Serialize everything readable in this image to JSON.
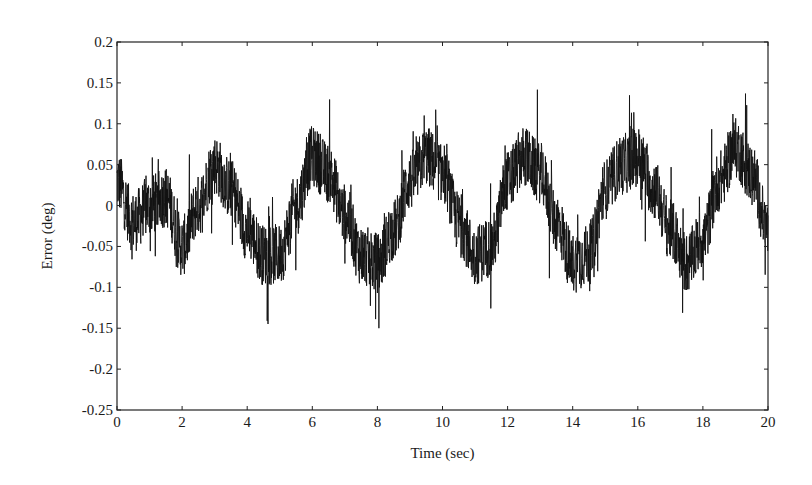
{
  "chart_data": {
    "type": "line",
    "title": "",
    "xlabel": "Time (sec)",
    "ylabel": "Error (deg)",
    "xlim": [
      0,
      20
    ],
    "ylim": [
      -0.25,
      0.2
    ],
    "xticks": [
      0,
      2,
      4,
      6,
      8,
      10,
      12,
      14,
      16,
      18,
      20
    ],
    "xtick_labels": [
      "0",
      "2",
      "4",
      "6",
      "8",
      "10",
      "12",
      "14",
      "16",
      "18",
      "20"
    ],
    "yticks": [
      0.2,
      0.15,
      0.1,
      0.05,
      0,
      -0.05,
      -0.1,
      -0.15,
      -0.2,
      -0.25
    ],
    "ytick_labels": [
      "0.2",
      "0.15",
      "0.1",
      "0.05",
      "0",
      "-0.05",
      "-0.1",
      "-0.15",
      "-0.2",
      "-0.25"
    ],
    "grid": false,
    "legend": null,
    "series": [
      {
        "name": "Error",
        "color": "#111111",
        "description": "Noisy quasi-sinusoidal tracking error, period ~3.2 s, amplitude ~0.07 deg, high-frequency noise ~±0.05 deg",
        "envelope_peaks": [
          {
            "x": 0.1,
            "y": 0.1
          },
          {
            "x": 3.0,
            "y": 0.15
          },
          {
            "x": 6.2,
            "y": 0.13
          },
          {
            "x": 9.5,
            "y": 0.12
          },
          {
            "x": 12.8,
            "y": 0.12
          },
          {
            "x": 16.0,
            "y": 0.13
          },
          {
            "x": 19.1,
            "y": 0.15
          }
        ],
        "envelope_troughs": [
          {
            "x": 1.1,
            "y": -0.12
          },
          {
            "x": 2.4,
            "y": -0.16
          },
          {
            "x": 4.8,
            "y": -0.17
          },
          {
            "x": 7.8,
            "y": -0.17
          },
          {
            "x": 11.2,
            "y": -0.16
          },
          {
            "x": 14.1,
            "y": -0.21
          },
          {
            "x": 17.5,
            "y": -0.14
          }
        ],
        "trend": {
          "x": [
            0,
            0.5,
            1.0,
            1.5,
            2.0,
            2.5,
            3.0,
            3.5,
            4.0,
            4.5,
            5.0,
            5.5,
            6.0,
            6.5,
            7.0,
            7.5,
            8.0,
            8.5,
            9.0,
            9.5,
            10.0,
            10.5,
            11.0,
            11.5,
            12.0,
            12.5,
            13.0,
            13.5,
            14.0,
            14.5,
            15.0,
            15.5,
            16.0,
            16.5,
            17.0,
            17.5,
            18.0,
            18.5,
            19.0,
            19.5,
            20.0
          ],
          "y": [
            0.03,
            -0.02,
            0.0,
            0.01,
            -0.05,
            0.0,
            0.05,
            0.02,
            -0.03,
            -0.06,
            -0.06,
            0.0,
            0.06,
            0.04,
            -0.01,
            -0.06,
            -0.07,
            -0.03,
            0.03,
            0.06,
            0.04,
            -0.02,
            -0.06,
            -0.05,
            0.03,
            0.06,
            0.04,
            -0.02,
            -0.07,
            -0.06,
            0.02,
            0.05,
            0.06,
            0.02,
            -0.03,
            -0.07,
            -0.04,
            0.03,
            0.07,
            0.04,
            -0.03
          ]
        }
      }
    ]
  },
  "plot_area": {
    "left": 117,
    "top": 42,
    "right": 768,
    "bottom": 410
  }
}
